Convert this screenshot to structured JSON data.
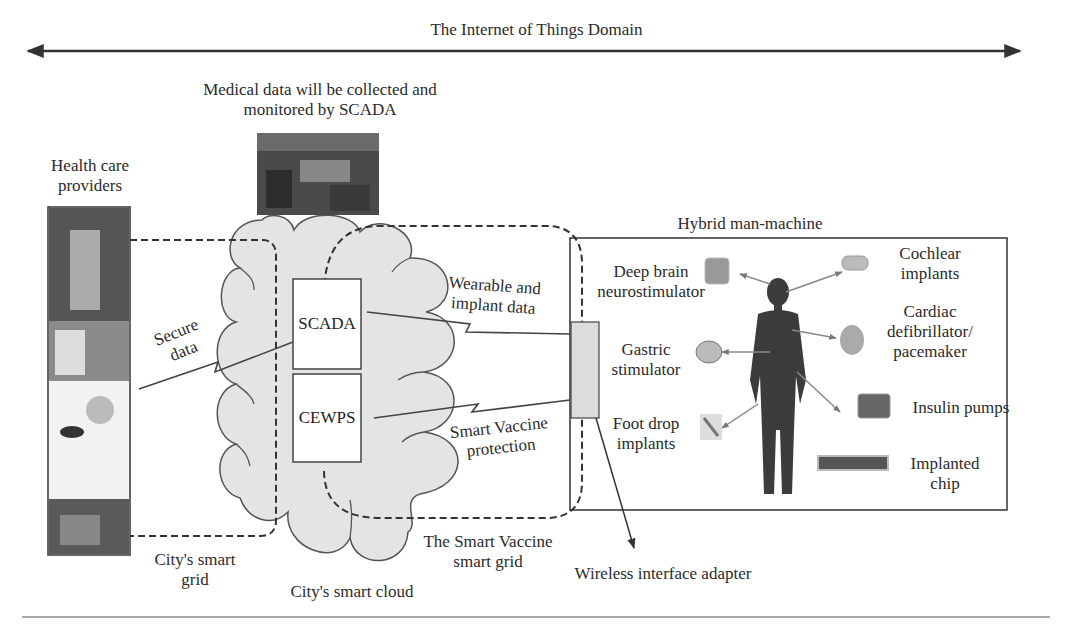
{
  "title": "The Internet of Things Domain",
  "scada_caption": [
    "Medical data will be collected and",
    "monitored by SCADA"
  ],
  "health_care": [
    "Health care",
    "providers"
  ],
  "secure_data": [
    "Secure",
    "data"
  ],
  "city_grid": [
    "City's smart",
    "grid"
  ],
  "city_cloud": "City's smart cloud",
  "smart_vaccine_grid": [
    "The Smart Vaccine",
    "smart grid"
  ],
  "wireless_adapter": "Wireless interface adapter",
  "boxes": {
    "scada": "SCADA",
    "cewps": "CEWPS"
  },
  "links": {
    "wearable": [
      "Wearable and",
      "implant data"
    ],
    "vaccine_protection": [
      "Smart Vaccine",
      "protection"
    ]
  },
  "hybrid": {
    "title": "Hybrid man-machine",
    "devices_left": [
      [
        "Deep brain",
        "neurostimulator"
      ],
      [
        "Gastric",
        "stimulator"
      ],
      [
        "Foot drop",
        "implants"
      ]
    ],
    "devices_right": [
      [
        "Cochlear",
        "implants"
      ],
      [
        "Cardiac",
        "defibrillator/",
        "pacemaker"
      ],
      [
        "Insulin pumps"
      ],
      [
        "Implanted",
        "chip"
      ]
    ]
  },
  "colors": {
    "cloud_fill": "#e4e4e4",
    "line": "#3a3a3a",
    "adapter_fill": "#dcdcdc"
  }
}
